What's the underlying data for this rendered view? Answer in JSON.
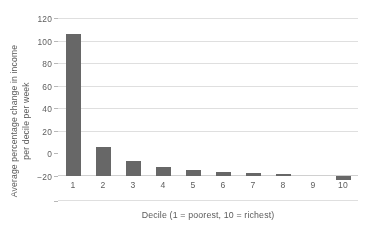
{
  "chart_data": {
    "type": "bar",
    "title": "",
    "xlabel": "Decile  (1 = poorest, 10 = richest)",
    "ylabel_line1": "Average  percentage change in income",
    "ylabel_line2": "per decile per  week",
    "ylabel": "Average percentage change in income per decile per week",
    "categories": [
      "1",
      "2",
      "3",
      "4",
      "5",
      "6",
      "7",
      "8",
      "9",
      "10"
    ],
    "values": [
      108,
      22,
      11.5,
      6.5,
      4.5,
      2.8,
      2.2,
      1.2,
      0,
      -3
    ],
    "series": [
      {
        "name": "Average percentage change in income per decile per week",
        "values": [
          108,
          22,
          11.5,
          6.5,
          4.5,
          2.8,
          2.2,
          1.2,
          0,
          -3
        ]
      }
    ],
    "ylim": [
      -20,
      120
    ],
    "yticks": [
      "120",
      "100",
      "80",
      "60",
      "40",
      "20",
      "0",
      "−20"
    ],
    "ytick_values": [
      120,
      100,
      80,
      60,
      40,
      20,
      0,
      -20
    ],
    "xlim_categories": 10,
    "grid": true,
    "grid_axis": "y",
    "legend": false,
    "legend_position": "none",
    "bar_color": "#636363",
    "gridline_color": "#e2e2e2",
    "background_color": "#ffffff",
    "text_color": "#555555"
  }
}
